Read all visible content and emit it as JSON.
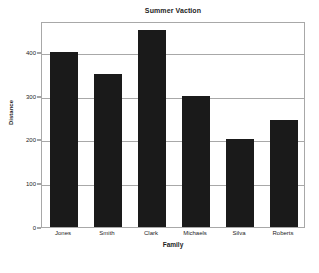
{
  "chart_data": {
    "type": "bar",
    "title": "Summer Vaction",
    "xlabel": "Family",
    "ylabel": "Distance",
    "categories": [
      "Jones",
      "Smith",
      "Clark",
      "Michaels",
      "Silva",
      "Roberts"
    ],
    "values": [
      400,
      350,
      450,
      300,
      200,
      245
    ],
    "series": [
      {
        "name": "Distance",
        "values": [
          400,
          350,
          450,
          300,
          200,
          245
        ]
      }
    ],
    "yticks": [
      0,
      100,
      200,
      300,
      400
    ],
    "ylim": [
      0,
      470
    ],
    "xlim": [
      0,
      6
    ],
    "grid": "horizontal",
    "legend": "none",
    "bar_color": "#1a1a1a",
    "grid_color": "#a8a8a8",
    "frame_color": "#a8a8a8",
    "text_color": "#1d1d1d",
    "background": "#ffffff"
  }
}
